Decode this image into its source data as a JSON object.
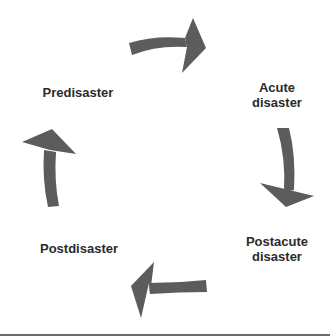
{
  "diagram": {
    "type": "cycle",
    "arrow_color": "#5c5c5c",
    "text_color": "#2b2b2b",
    "stages": [
      {
        "id": "predisaster",
        "lines": [
          "Predisaster"
        ]
      },
      {
        "id": "acute",
        "lines": [
          "Acute",
          "disaster"
        ]
      },
      {
        "id": "postacute",
        "lines": [
          "Postacute",
          "disaster"
        ]
      },
      {
        "id": "postdisaster",
        "lines": [
          "Postdisaster"
        ]
      }
    ],
    "flow": [
      {
        "from": "Predisaster",
        "to": "Acute disaster",
        "direction": "clockwise"
      },
      {
        "from": "Acute disaster",
        "to": "Postacute disaster",
        "direction": "clockwise"
      },
      {
        "from": "Postacute disaster",
        "to": "Postdisaster",
        "direction": "clockwise"
      },
      {
        "from": "Postdisaster",
        "to": "Predisaster",
        "direction": "clockwise"
      }
    ]
  }
}
